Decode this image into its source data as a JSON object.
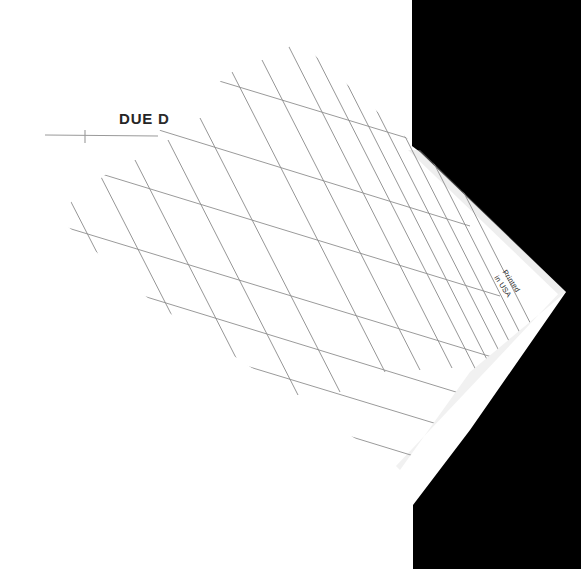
{
  "image": {
    "subject": "scanned tilted sheet of ruled ledger grid paper",
    "background_color": "#ffffff",
    "shadow_color": "#000000",
    "paper_color": "#fdfdfd",
    "grid_line_color": "#8a8a8a",
    "rule_line_color": "#9a9a9a",
    "text_color": "#252525"
  },
  "paper": {
    "label_due": "DUE",
    "label_due_partial": "D",
    "printed_line_1": "Printed",
    "printed_line_2": "in USA"
  },
  "grid": {
    "column_count": 13,
    "row_count": 9,
    "column_spacing_px": 35,
    "row_spacing_px": 50,
    "column_angle_deg": 62,
    "row_angle_deg": 17
  },
  "rule": {
    "underline_present": true,
    "tick_present": true
  }
}
